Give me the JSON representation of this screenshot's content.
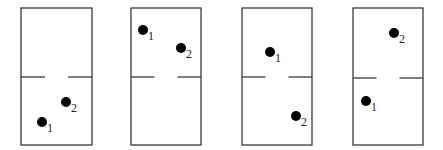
{
  "diagram": {
    "panels": [
      {
        "id": "panel-1",
        "x": 21,
        "y": 8,
        "w": 71,
        "h": 137,
        "divider_y": 77,
        "particles": [
          {
            "label": "1",
            "cx": 42,
            "cy": 122
          },
          {
            "label": "2",
            "cx": 66,
            "cy": 102
          }
        ]
      },
      {
        "id": "panel-2",
        "x": 131,
        "y": 8,
        "w": 70,
        "h": 137,
        "divider_y": 77,
        "particles": [
          {
            "label": "1",
            "cx": 143,
            "cy": 30
          },
          {
            "label": "2",
            "cx": 181,
            "cy": 48
          }
        ]
      },
      {
        "id": "panel-3",
        "x": 242,
        "y": 8,
        "w": 70,
        "h": 137,
        "divider_y": 77,
        "particles": [
          {
            "label": "1",
            "cx": 270,
            "cy": 52
          },
          {
            "label": "2",
            "cx": 296,
            "cy": 116
          }
        ]
      },
      {
        "id": "panel-4",
        "x": 353,
        "y": 8,
        "w": 70,
        "h": 137,
        "divider_y": 78,
        "particles": [
          {
            "label": "1",
            "cx": 366,
            "cy": 101
          },
          {
            "label": "2",
            "cx": 394,
            "cy": 33
          }
        ]
      }
    ],
    "doorway_gap": 23,
    "dot_radius": 5,
    "colors": {
      "line": "#3a3a3a",
      "dot": "#000000",
      "label": "#222222"
    }
  }
}
